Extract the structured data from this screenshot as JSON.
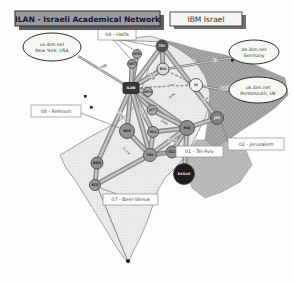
{
  "palette": {
    "land": "#ececec",
    "land_dot": "#d2d2d2",
    "region_dark": "#a6a6a6",
    "region_mid": "#bdbdbd",
    "edge_dark": "#8a8a8a",
    "edge_light": "#c6c6c6",
    "leader": "#7a7a7a",
    "left_title_bg": "#9a9a9a",
    "right_title_bg": "#f5f5f0",
    "title_text": "#15153a"
  },
  "header": {
    "left_title": "ILAN - Israeli Academical Network",
    "right_title": "IBM Israel"
  },
  "callouts": [
    {
      "id": "us-ibm-net",
      "line1": "us.ibm.net",
      "line2": "New York, USA",
      "cx": 52,
      "cy": 47,
      "rx": 29,
      "ry": 14,
      "link": [
        78,
        56,
        127,
        86
      ]
    },
    {
      "id": "de-ibm-net",
      "line1": "de.ibm.net",
      "line2": "Germany",
      "cx": 254,
      "cy": 52,
      "rx": 25,
      "ry": 12,
      "link": [
        230,
        58,
        167,
        69
      ]
    },
    {
      "id": "uk-ibm-net",
      "line1": "uk.ibm.net",
      "line2": "Portsmouth, UK",
      "cx": 258,
      "cy": 90,
      "rx": 29,
      "ry": 13,
      "link": [
        230,
        91,
        201,
        86
      ]
    }
  ],
  "site_labels": [
    {
      "text": "04 - Haifa",
      "x": 98,
      "y": 29,
      "w": 38,
      "h": 11,
      "leaders": [
        [
          118,
          40,
          137,
          52
        ],
        [
          122,
          40,
          158,
          47
        ],
        [
          114,
          40,
          133,
          62
        ]
      ]
    },
    {
      "text": "08 - Rehovot",
      "x": 31,
      "y": 105,
      "w": 50,
      "h": 12,
      "leaders": [
        [
          81,
          113,
          122,
          129
        ]
      ]
    },
    {
      "text": "01 - Tel-Aviv",
      "x": 176,
      "y": 146,
      "w": 47,
      "h": 11,
      "leaders": [
        [
          176,
          151,
          157,
          154
        ],
        [
          176,
          151,
          171,
          152
        ]
      ]
    },
    {
      "text": "02 - Jerusalem",
      "x": 228,
      "y": 138,
      "w": 56,
      "h": 12,
      "leaders": [
        [
          228,
          143,
          221,
          121
        ]
      ]
    },
    {
      "text": "07 - Beer-Sheva",
      "x": 103,
      "y": 194,
      "w": 55,
      "h": 11,
      "leaders": [
        [
          117,
          194,
          97,
          187
        ]
      ]
    }
  ],
  "network": {
    "nodes": [
      {
        "id": "tec",
        "label": "TEC",
        "x": 162,
        "y": 46,
        "r": 6,
        "fill": "#4f4f4f",
        "text": "#e8e8e8"
      },
      {
        "id": "hfa",
        "label": "HFA",
        "x": 137,
        "y": 54,
        "r": 4.5,
        "fill": "#a6a6a6",
        "text": "#333333"
      },
      {
        "id": "ort",
        "label": "ORT",
        "x": 132,
        "y": 64,
        "r": 4.5,
        "fill": "#a6a6a6",
        "text": "#333333"
      },
      {
        "id": "biu",
        "label": "BIU",
        "x": 163,
        "y": 69,
        "r": 6,
        "fill": "#d8d8d8",
        "text": "#333333"
      },
      {
        "id": "hub",
        "label": "ILAN",
        "x": 131,
        "y": 88,
        "square": true,
        "w": 16,
        "h": 11,
        "fill": "#383838",
        "text": "#ffffff"
      },
      {
        "id": "opu",
        "label": "OPU",
        "x": 148,
        "y": 92,
        "r": 4.5,
        "fill": "#b5b5b5",
        "text": "#333333"
      },
      {
        "id": "ix",
        "label": "IX",
        "x": 196,
        "y": 85,
        "r": 6.5,
        "fill": "#f4f4f4",
        "text": "#333333"
      },
      {
        "id": "jct",
        "label": "JCT",
        "x": 152,
        "y": 110,
        "r": 5,
        "fill": "#ababab",
        "text": "#333333"
      },
      {
        "id": "wis",
        "label": "WIS",
        "x": 127,
        "y": 131,
        "r": 7.5,
        "fill": "#939393",
        "text": "#222222"
      },
      {
        "id": "mll",
        "label": "MLL",
        "x": 153,
        "y": 132,
        "r": 5.5,
        "fill": "#a0a0a0",
        "text": "#333333"
      },
      {
        "id": "huj",
        "label": "HUJ",
        "x": 187,
        "y": 128,
        "r": 7.5,
        "fill": "#8c8c8c",
        "text": "#222222"
      },
      {
        "id": "jer",
        "label": "JER",
        "x": 217,
        "y": 118,
        "r": 6.5,
        "fill": "#808080",
        "text": "#eeeeee"
      },
      {
        "id": "tau",
        "label": "TAU",
        "x": 150,
        "y": 155,
        "r": 6.5,
        "fill": "#999999",
        "text": "#222222"
      },
      {
        "id": "ibm",
        "label": "IBM",
        "x": 172,
        "y": 152,
        "r": 6,
        "fill": "#8f8f8f",
        "text": "#222222"
      },
      {
        "id": "bgu",
        "label": "BGU",
        "x": 97,
        "y": 163,
        "r": 6,
        "fill": "#8f8f8f",
        "text": "#222222"
      },
      {
        "id": "sce",
        "label": "SCE",
        "x": 95,
        "y": 185,
        "r": 5.5,
        "fill": "#9a9a9a",
        "text": "#222222"
      },
      {
        "id": "barak",
        "label": "BARAK",
        "x": 184,
        "y": 174,
        "r": 10.5,
        "fill": "#1c1c1c",
        "text": "#dddddd"
      }
    ],
    "edges": [
      [
        "hub",
        "tec"
      ],
      [
        "hub",
        "hfa"
      ],
      [
        "hub",
        "ort"
      ],
      [
        "hub",
        "biu"
      ],
      [
        "hub",
        "opu"
      ],
      [
        "hub",
        "jct"
      ],
      [
        "hub",
        "wis"
      ],
      [
        "hub",
        "mll"
      ],
      [
        "hub",
        "huj"
      ],
      [
        "hub",
        "tau"
      ],
      [
        "hub",
        "bgu"
      ],
      [
        "biu",
        "tec"
      ],
      [
        "tec",
        "jer"
      ],
      [
        "jer",
        "huj"
      ],
      [
        "huj",
        "mll"
      ],
      [
        "huj",
        "jct"
      ],
      [
        "huj",
        "ibm"
      ],
      [
        "huj",
        "tau"
      ],
      [
        "huj",
        "barak"
      ],
      [
        "wis",
        "tau"
      ],
      [
        "tau",
        "ibm"
      ],
      [
        "tau",
        "sce"
      ],
      [
        "bgu",
        "sce"
      ],
      [
        "mll",
        "tau"
      ]
    ],
    "thin_edges": [
      [
        "hub",
        "ix"
      ],
      [
        "biu",
        "ix"
      ]
    ],
    "bandwidth_labels": [
      {
        "text": "2MB",
        "x": 100,
        "y": 70,
        "rot": -28
      },
      {
        "text": "E1",
        "x": 213,
        "y": 62,
        "rot": -12
      },
      {
        "text": "512K",
        "x": 221,
        "y": 90,
        "rot": -8
      },
      {
        "text": "2MB",
        "x": 149,
        "y": 73,
        "rot": 60
      },
      {
        "text": "512K",
        "x": 139,
        "y": 108,
        "rot": 72
      },
      {
        "text": "128K",
        "x": 117,
        "y": 112,
        "rot": 55
      },
      {
        "text": "2MB",
        "x": 160,
        "y": 121,
        "rot": 35
      },
      {
        "text": "64K",
        "x": 170,
        "y": 99,
        "rot": -40
      },
      {
        "text": "2M",
        "x": 168,
        "y": 87,
        "rot": -3
      },
      {
        "text": "2MB",
        "x": 168,
        "y": 141,
        "rot": 15
      },
      {
        "text": "512K",
        "x": 122,
        "y": 148,
        "rot": 48
      },
      {
        "text": "64K",
        "x": 203,
        "y": 103,
        "rot": -35
      }
    ],
    "south_link": [
      97,
      186,
      127,
      259
    ],
    "city_dots": [
      [
        84,
        95
      ],
      [
        90,
        106
      ],
      [
        250,
        88
      ],
      [
        231,
        59
      ]
    ],
    "south_tip_dot": [
      128,
      261
    ]
  }
}
